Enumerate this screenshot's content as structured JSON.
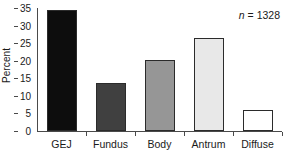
{
  "chart_data": {
    "type": "bar",
    "title": "",
    "subtitle": "",
    "xlabel": "",
    "ylabel": "Percent",
    "categories": [
      "GEJ",
      "Fundus",
      "Body",
      "Antrum",
      "Diffuse"
    ],
    "values": [
      34.4,
      13.8,
      20.1,
      26.4,
      5.9
    ],
    "series": [
      {
        "name": "Percent",
        "values": [
          34.4,
          13.8,
          20.1,
          26.4,
          5.9
        ]
      }
    ],
    "bar_colors": [
      "#0d0d0d",
      "#404040",
      "#969696",
      "#e8e8e8",
      "#ffffff"
    ],
    "bar_edge_color": "#2b2b2b",
    "ylim": [
      0,
      35
    ],
    "yticks": [
      0,
      5,
      10,
      15,
      20,
      25,
      30,
      35
    ],
    "ytick_labels": [
      "0",
      "5",
      "10",
      "15",
      "20",
      "25",
      "30",
      "35"
    ],
    "grid": false,
    "legend": "none",
    "annotations": [
      {
        "name": "sample-size",
        "italic_part": "n",
        "rest": " = 1328",
        "text": "n = 1328",
        "position": "top-right"
      }
    ],
    "axis_color": "#4a4a4a",
    "background": "#ffffff"
  }
}
